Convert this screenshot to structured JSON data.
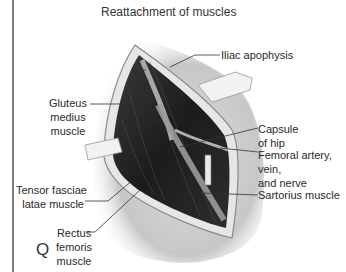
{
  "figure": {
    "title": "Reattachment of muscles",
    "panel_letter": "Q",
    "labels": {
      "iliac_apophysis": "Iliac apophysis",
      "gluteus_medius": [
        "Gluteus",
        "medius",
        "muscle"
      ],
      "capsule_of_hip": [
        "Capsule",
        "of hip"
      ],
      "femoral_bundle": [
        "Femoral artery,",
        "vein,",
        "and nerve"
      ],
      "sartorius": "Sartorius muscle",
      "tensor_fasciae_latae": [
        "Tensor fasciae",
        "latae muscle"
      ],
      "rectus_femoris": [
        "Rectus",
        "femoris",
        "muscle"
      ]
    }
  }
}
